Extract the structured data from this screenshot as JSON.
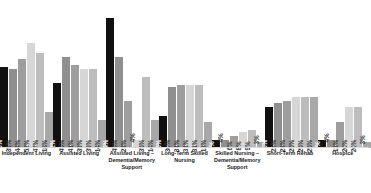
{
  "chart_data": {
    "type": "bar",
    "title": "",
    "subtitle": "",
    "xlabel": "",
    "ylabel": "",
    "ylim": [
      0,
      70
    ],
    "grid": false,
    "legend_position": "none",
    "categories": [
      "Independent Living",
      "Assisted Living",
      "Assisted Living – Dementia/Memory Support",
      "Long-Term Skilled Nursing",
      "Skilled Nursing – Dementia/Memory Support",
      "Short-Term Rehab",
      "Hospice"
    ],
    "series": [
      {
        "name": "Series 1",
        "color": "#111111",
        "values": [
          40,
          32,
          64,
          16,
          4,
          20,
          4
        ]
      },
      {
        "name": "Series 2",
        "color": "#8f8f8f",
        "values": [
          39,
          45,
          45,
          30,
          4,
          22,
          4
        ]
      },
      {
        "name": "Series 3",
        "color": "#9e9e9e",
        "values": [
          44,
          41,
          23,
          31,
          6,
          23,
          13
        ]
      },
      {
        "name": "Series 4",
        "color": "#d6d6d6",
        "values": [
          52,
          39,
          4,
          31,
          8,
          25,
          20
        ]
      },
      {
        "name": "Series 5",
        "color": "#bdbdbd",
        "values": [
          47,
          39,
          35,
          31,
          9,
          25,
          20
        ]
      },
      {
        "name": "Series 6",
        "color": "#a8a8a8",
        "values": [
          18,
          14,
          14,
          13,
          3,
          25,
          3
        ]
      }
    ],
    "bars": [
      {
        "category": "Independent Living",
        "items": [
          {
            "value": 40,
            "label": "40%",
            "color": "#111111",
            "label_style": "inside-dark"
          },
          {
            "value": 39,
            "label": "39%",
            "color": "#8f8f8f",
            "label_style": "inside-light"
          },
          {
            "value": 44,
            "label": "44%",
            "color": "#9e9e9e",
            "label_style": "inside-light"
          },
          {
            "value": 52,
            "label": "52%",
            "color": "#d6d6d6",
            "label_style": "inside-light"
          },
          {
            "value": 47,
            "label": "47%",
            "color": "#bdbdbd",
            "label_style": "inside-light"
          },
          {
            "value": 18,
            "label": "18%",
            "color": "#a8a8a8",
            "label_style": "inside-light"
          }
        ]
      },
      {
        "category": "Assisted Living",
        "items": [
          {
            "value": 32,
            "label": "32%",
            "color": "#111111",
            "label_style": "inside-dark"
          },
          {
            "value": 45,
            "label": "45%",
            "color": "#8f8f8f",
            "label_style": "inside-light"
          },
          {
            "value": 41,
            "label": "41%",
            "color": "#9e9e9e",
            "label_style": "inside-light"
          },
          {
            "value": 39,
            "label": "39%",
            "color": "#d6d6d6",
            "label_style": "inside-light"
          },
          {
            "value": 39,
            "label": "39%",
            "color": "#bdbdbd",
            "label_style": "inside-light"
          },
          {
            "value": 14,
            "label": "14%",
            "color": "#a8a8a8",
            "label_style": "inside-light"
          }
        ]
      },
      {
        "category": "Assisted Living – Dementia/Memory Support",
        "items": [
          {
            "value": 64,
            "label": "64%",
            "color": "#111111",
            "label_style": "inside-dark"
          },
          {
            "value": 45,
            "label": "45%",
            "color": "#8f8f8f",
            "label_style": "inside-light"
          },
          {
            "value": 23,
            "label": "23%",
            "color": "#9e9e9e",
            "label_style": "inside-light"
          },
          {
            "value": 4,
            "label": "4%",
            "color": "#d6d6d6",
            "label_style": "outside"
          },
          {
            "value": 35,
            "label": "35%",
            "color": "#bdbdbd",
            "label_style": "inside-light"
          },
          {
            "value": 14,
            "label": "14%",
            "color": "#a8a8a8",
            "label_style": "inside-light"
          }
        ]
      },
      {
        "category": "Long-Term Skilled Nursing",
        "items": [
          {
            "value": 16,
            "label": "16%",
            "color": "#111111",
            "label_style": "inside-dark"
          },
          {
            "value": 30,
            "label": "30%",
            "color": "#8f8f8f",
            "label_style": "inside-light"
          },
          {
            "value": 31,
            "label": "31%",
            "color": "#9e9e9e",
            "label_style": "inside-light"
          },
          {
            "value": 31,
            "label": "31%",
            "color": "#d6d6d6",
            "label_style": "inside-light"
          },
          {
            "value": 31,
            "label": "31%",
            "color": "#bdbdbd",
            "label_style": "inside-light"
          },
          {
            "value": 13,
            "label": "13%",
            "color": "#a8a8a8",
            "label_style": "inside-light"
          }
        ]
      },
      {
        "category": "Skilled Nursing – Dementia/Memory Support",
        "items": [
          {
            "value": 4,
            "label": "4%",
            "color": "#111111",
            "label_style": "inside-dark"
          },
          {
            "value": 4,
            "label": "4%",
            "color": "#8f8f8f",
            "label_style": "outside"
          },
          {
            "value": 6,
            "label": "6%",
            "color": "#9e9e9e",
            "label_style": "inside-light"
          },
          {
            "value": 8,
            "label": "8%",
            "color": "#d6d6d6",
            "label_style": "inside-light"
          },
          {
            "value": 9,
            "label": "9%",
            "color": "#bdbdbd",
            "label_style": "inside-light"
          },
          {
            "value": 3,
            "label": "3%",
            "color": "#a8a8a8",
            "label_style": "outside"
          }
        ]
      },
      {
        "category": "Short-Term Rehab",
        "items": [
          {
            "value": 20,
            "label": "20%",
            "color": "#111111",
            "label_style": "inside-dark"
          },
          {
            "value": 22,
            "label": "22%",
            "color": "#8f8f8f",
            "label_style": "inside-light"
          },
          {
            "value": 23,
            "label": "23%",
            "color": "#9e9e9e",
            "label_style": "inside-light"
          },
          {
            "value": 25,
            "label": "25%",
            "color": "#d6d6d6",
            "label_style": "inside-light"
          },
          {
            "value": 25,
            "label": "25%",
            "color": "#bdbdbd",
            "label_style": "inside-light"
          },
          {
            "value": 25,
            "label": "25%",
            "color": "#a8a8a8",
            "label_style": "inside-light"
          }
        ]
      },
      {
        "category": "Hospice",
        "items": [
          {
            "value": 4,
            "label": "4%",
            "color": "#111111",
            "label_style": "inside-dark"
          },
          {
            "value": 4,
            "label": "4%",
            "color": "#8f8f8f",
            "label_style": "outside"
          },
          {
            "value": 13,
            "label": "13%",
            "color": "#9e9e9e",
            "label_style": "inside-light"
          },
          {
            "value": 20,
            "label": "20%",
            "color": "#d6d6d6",
            "label_style": "inside-light"
          },
          {
            "value": 20,
            "label": "20%",
            "color": "#bdbdbd",
            "label_style": "inside-light"
          },
          {
            "value": 3,
            "label": "3%",
            "color": "#a8a8a8",
            "label_style": "outside"
          }
        ]
      }
    ]
  }
}
